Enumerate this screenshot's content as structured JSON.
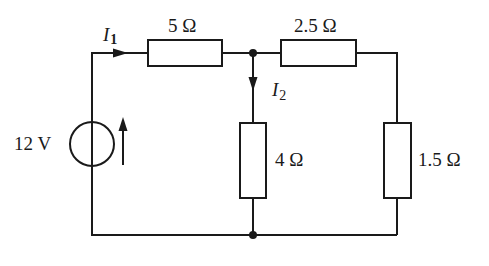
{
  "diagram": {
    "type": "circuit",
    "colors": {
      "stroke": "#1a1a1a",
      "background": "#ffffff"
    },
    "source": {
      "label": "12 V",
      "value_v": 12
    },
    "resistors": [
      {
        "id": "R1",
        "label": "5 Ω",
        "value_ohm": 5
      },
      {
        "id": "R2",
        "label": "2.5 Ω",
        "value_ohm": 2.5
      },
      {
        "id": "R3",
        "label": "4 Ω",
        "value_ohm": 4
      },
      {
        "id": "R4",
        "label": "1.5 Ω",
        "value_ohm": 1.5
      }
    ],
    "currents": [
      {
        "symbol": "I",
        "subscript": "1"
      },
      {
        "symbol": "I",
        "subscript": "2"
      }
    ]
  }
}
